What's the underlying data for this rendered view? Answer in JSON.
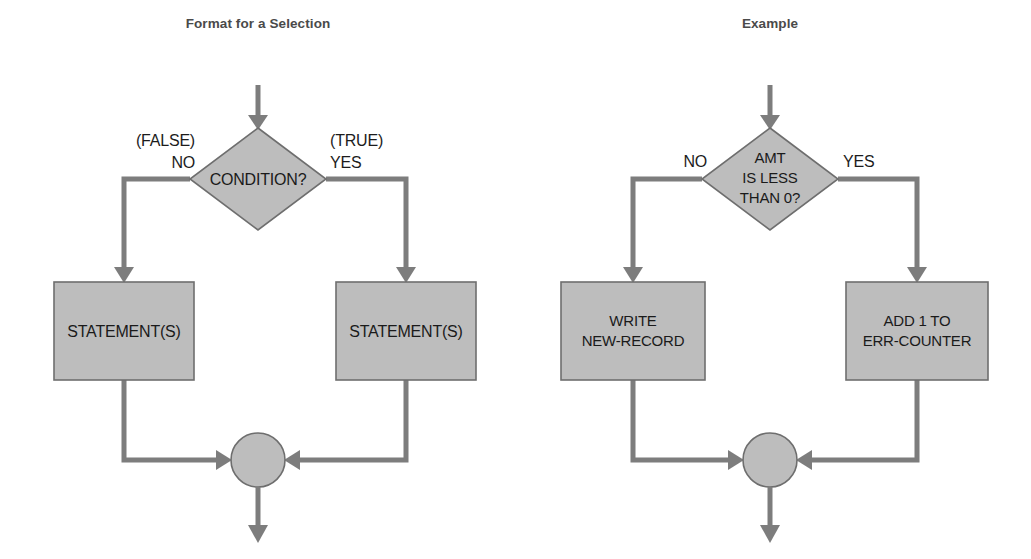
{
  "canvas": {
    "width": 1031,
    "height": 559,
    "background": "#ffffff"
  },
  "style": {
    "shape_fill": "#bdbdbd",
    "shape_stroke": "#6e6e6e",
    "connector_color": "#7d7d7d",
    "title_color": "#4a4a4a",
    "text_color": "#1a1a1a"
  },
  "panels": [
    {
      "id": "format",
      "title": "Format for a Selection",
      "title_x": 258,
      "title_y": 28,
      "decision": {
        "text_lines": [
          "CONDITION?"
        ],
        "cx": 258,
        "cy": 179,
        "rx": 68,
        "ry": 51
      },
      "labels": {
        "left": {
          "lines": [
            "(FALSE)",
            "NO"
          ],
          "x": 195,
          "y": 146,
          "anchor": "end"
        },
        "right": {
          "lines": [
            "(TRUE)",
            "YES"
          ],
          "x": 330,
          "y": 146,
          "anchor": "start"
        }
      },
      "boxes": [
        {
          "id": "left-box",
          "text_lines": [
            "STATEMENT(S)"
          ],
          "x": 54,
          "y": 282,
          "w": 140,
          "h": 98
        },
        {
          "id": "right-box",
          "text_lines": [
            "STATEMENT(S)"
          ],
          "x": 336,
          "y": 282,
          "w": 140,
          "h": 98
        }
      ],
      "merge": {
        "cx": 258,
        "cy": 460,
        "r": 27
      },
      "entry_arrow": {
        "x": 258,
        "y_start": 85,
        "y_end": 128
      },
      "exit_arrow": {
        "x": 258,
        "y_start": 487,
        "y_end": 543
      }
    },
    {
      "id": "example",
      "title": "Example",
      "title_x": 770,
      "title_y": 28,
      "decision": {
        "text_lines": [
          "AMT",
          "IS LESS",
          "THAN 0?"
        ],
        "cx": 770,
        "cy": 179,
        "rx": 68,
        "ry": 51
      },
      "labels": {
        "left": {
          "lines": [
            "NO"
          ],
          "x": 707,
          "y": 167,
          "anchor": "end"
        },
        "right": {
          "lines": [
            "YES"
          ],
          "x": 843,
          "y": 167,
          "anchor": "start"
        }
      },
      "boxes": [
        {
          "id": "left-box",
          "text_lines": [
            "WRITE",
            "NEW-RECORD"
          ],
          "x": 561,
          "y": 282,
          "w": 144,
          "h": 98
        },
        {
          "id": "right-box",
          "text_lines": [
            "ADD 1 TO",
            "ERR-COUNTER"
          ],
          "x": 846,
          "y": 282,
          "w": 142,
          "h": 98
        }
      ],
      "merge": {
        "cx": 770,
        "cy": 460,
        "r": 27
      },
      "entry_arrow": {
        "x": 770,
        "y_start": 85,
        "y_end": 128
      },
      "exit_arrow": {
        "x": 770,
        "y_start": 487,
        "y_end": 543
      }
    }
  ]
}
